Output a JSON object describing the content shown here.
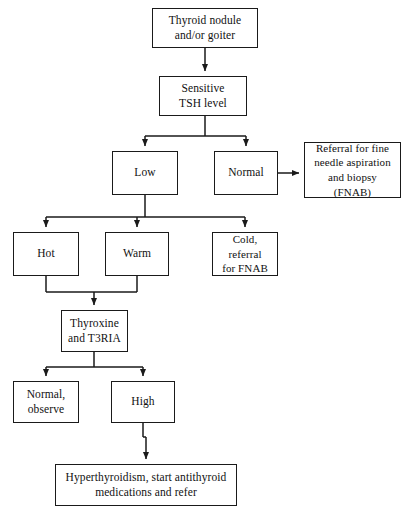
{
  "diagram": {
    "stroke_color": "#1a1a1a",
    "background_color": "#ffffff",
    "width": 410,
    "height": 515,
    "nodes": [
      {
        "id": "thyroid-nodule",
        "label": "Thyroid nodule\nand/or goiter",
        "x": 152,
        "y": 8,
        "w": 106,
        "h": 40
      },
      {
        "id": "sensitive-tsh",
        "label": "Sensitive\nTSH level",
        "x": 159,
        "y": 76,
        "w": 88,
        "h": 40
      },
      {
        "id": "low",
        "label": "Low",
        "x": 112,
        "y": 151,
        "w": 66,
        "h": 44
      },
      {
        "id": "normal",
        "label": "Normal",
        "x": 214,
        "y": 151,
        "w": 64,
        "h": 44
      },
      {
        "id": "referral-fnab",
        "label": "Referral for fine\nneedle aspiration\nand biopsy\n(FNAB)",
        "x": 304,
        "y": 142,
        "w": 97,
        "h": 56
      },
      {
        "id": "hot",
        "label": "Hot",
        "x": 13,
        "y": 232,
        "w": 66,
        "h": 44
      },
      {
        "id": "warm",
        "label": "Warm",
        "x": 105,
        "y": 232,
        "w": 64,
        "h": 44
      },
      {
        "id": "cold-referral",
        "label": "Cold, referral\nfor FNAB",
        "x": 212,
        "y": 232,
        "w": 66,
        "h": 44
      },
      {
        "id": "thyroxine-t3ria",
        "label": "Thyroxine\nand T3RIA",
        "x": 61,
        "y": 310,
        "w": 67,
        "h": 42
      },
      {
        "id": "normal-observe",
        "label": "Normal,\nobserve",
        "x": 13,
        "y": 381,
        "w": 66,
        "h": 42
      },
      {
        "id": "high",
        "label": "High",
        "x": 111,
        "y": 381,
        "w": 64,
        "h": 42
      },
      {
        "id": "hyperthyroidism",
        "label": "Hyperthyroidism, start antithyroid\nmedications and refer",
        "x": 55,
        "y": 464,
        "w": 182,
        "h": 42
      }
    ],
    "edges": [
      {
        "id": "edge-nodule-to-tsh",
        "from": "thyroid-nodule",
        "to": "sensitive-tsh",
        "kind": "vertical-arrow"
      },
      {
        "id": "edge-tsh-split",
        "from": "sensitive-tsh",
        "to": "low-and-normal",
        "kind": "split-two"
      },
      {
        "id": "edge-normal-to-fnab",
        "from": "normal",
        "to": "referral-fnab",
        "kind": "horizontal-arrow"
      },
      {
        "id": "edge-low-split",
        "from": "low",
        "to": "hot-warm-cold",
        "kind": "split-three"
      },
      {
        "id": "edge-hot-warm-merge",
        "from": "hot-and-warm",
        "to": "thyroxine-t3ria",
        "kind": "merge-two"
      },
      {
        "id": "edge-thyroxine-split",
        "from": "thyroxine-t3ria",
        "to": "normal-observe-and-high",
        "kind": "split-two"
      },
      {
        "id": "edge-high-to-hyper",
        "from": "high",
        "to": "hyperthyroidism",
        "kind": "vertical-arrow"
      }
    ]
  }
}
